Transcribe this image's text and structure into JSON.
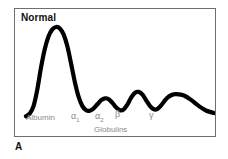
{
  "figure": {
    "panel_letter": "A",
    "title": "Normal",
    "frame_color": "#6e6e6e",
    "trace_color": "#000000",
    "label_color": "#8a8a8a",
    "title_color": "#111111"
  },
  "labels": {
    "albumin": "Albumin",
    "alpha1_base": "α",
    "alpha1_sub": "1",
    "alpha2_base": "α",
    "alpha2_sub": "2",
    "beta": "β",
    "gamma": "γ",
    "globulins": "Globulins"
  },
  "chart_data": {
    "type": "line",
    "title": "Normal",
    "xlabel": "Globulins",
    "ylabel": "",
    "grid": false,
    "legend": null,
    "annotations": [
      {
        "text": "Albumin",
        "x": 0.08,
        "y": 0.06
      },
      {
        "text": "α1",
        "x": 0.3,
        "y": 0.06
      },
      {
        "text": "α2",
        "x": 0.42,
        "y": 0.06
      },
      {
        "text": "β",
        "x": 0.53,
        "y": 0.06
      },
      {
        "text": "γ",
        "x": 0.7,
        "y": 0.06
      },
      {
        "text": "Globulins",
        "x": 0.48,
        "y": -0.04
      }
    ],
    "xlim": [
      0,
      1
    ],
    "ylim": [
      0,
      1
    ],
    "series": [
      {
        "name": "Normal serum protein electrophoresis densitometry tracing",
        "x": [
          0.0,
          0.02,
          0.04,
          0.06,
          0.08,
          0.1,
          0.12,
          0.14,
          0.16,
          0.18,
          0.2,
          0.22,
          0.24,
          0.26,
          0.28,
          0.3,
          0.32,
          0.34,
          0.36,
          0.38,
          0.4,
          0.42,
          0.44,
          0.46,
          0.48,
          0.5,
          0.52,
          0.54,
          0.56,
          0.58,
          0.6,
          0.62,
          0.64,
          0.66,
          0.68,
          0.7,
          0.72,
          0.74,
          0.76,
          0.78,
          0.8,
          0.84,
          0.88,
          0.92,
          0.96,
          1.0
        ],
        "y": [
          0.03,
          0.06,
          0.14,
          0.32,
          0.56,
          0.76,
          0.9,
          0.975,
          1.0,
          0.985,
          0.92,
          0.79,
          0.6,
          0.4,
          0.24,
          0.14,
          0.095,
          0.09,
          0.115,
          0.16,
          0.205,
          0.225,
          0.215,
          0.175,
          0.125,
          0.095,
          0.105,
          0.16,
          0.235,
          0.285,
          0.295,
          0.265,
          0.2,
          0.14,
          0.105,
          0.11,
          0.15,
          0.205,
          0.245,
          0.265,
          0.27,
          0.255,
          0.205,
          0.14,
          0.09,
          0.065
        ],
        "peaks": [
          {
            "label": "Albumin",
            "x": 0.16,
            "y": 1.0,
            "width": "narrow"
          },
          {
            "label": "α1",
            "x": 0.42,
            "y": 0.225,
            "width": "small"
          },
          {
            "label": "α2",
            "x": 0.6,
            "y": 0.295,
            "width": "small"
          },
          {
            "label": "β",
            "x": 0.8,
            "y": 0.27,
            "width": "small"
          },
          {
            "label": "γ",
            "x": 0.7,
            "y": 0.27,
            "width": "broad"
          }
        ]
      }
    ]
  }
}
